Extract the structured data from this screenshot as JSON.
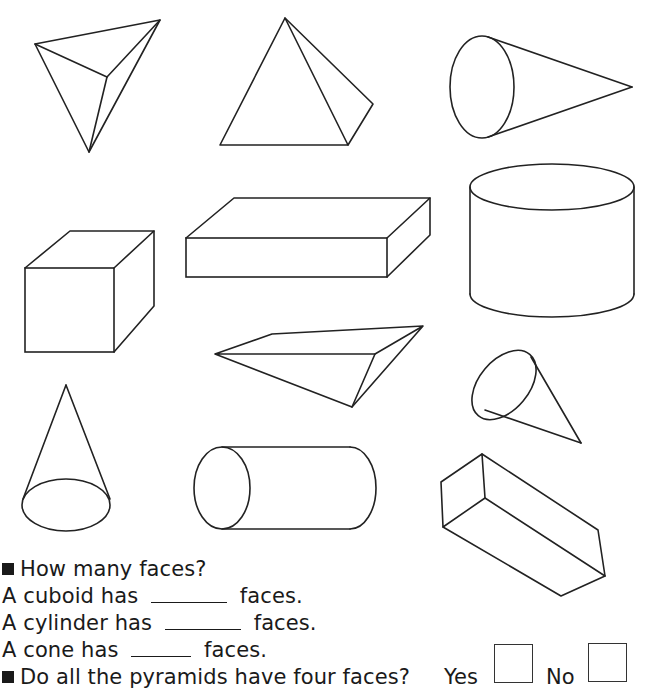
{
  "worksheet": {
    "shapes": [
      {
        "id": "tetrahedron",
        "label": "triangular-based pyramid"
      },
      {
        "id": "square-pyramid",
        "label": "square-based pyramid"
      },
      {
        "id": "cone-horizontal",
        "label": "cone"
      },
      {
        "id": "cube",
        "label": "cube"
      },
      {
        "id": "cuboid-flat",
        "label": "cuboid"
      },
      {
        "id": "cylinder-upright",
        "label": "cylinder"
      },
      {
        "id": "pyramid-horizontal",
        "label": "pyramid"
      },
      {
        "id": "cone-tilted",
        "label": "cone"
      },
      {
        "id": "cone-upright",
        "label": "cone"
      },
      {
        "id": "cylinder-horizontal",
        "label": "cylinder"
      },
      {
        "id": "cuboid-tilted",
        "label": "cuboid"
      }
    ],
    "questions": {
      "heading": "How many faces?",
      "lines": [
        {
          "prefix": "A cuboid has",
          "suffix": "faces.",
          "answer": ""
        },
        {
          "prefix": "A cylinder has",
          "suffix": "faces.",
          "answer": ""
        },
        {
          "prefix": "A cone has",
          "suffix": "faces.",
          "answer": ""
        }
      ],
      "pyramid_question": "Do all the pyramids have four faces?",
      "yes_label": "Yes",
      "no_label": "No"
    }
  }
}
